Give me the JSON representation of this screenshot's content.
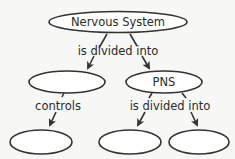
{
  "diagram": {
    "type": "concept-map",
    "nodes": [
      {
        "id": "root",
        "label": "Nervous System"
      },
      {
        "id": "left",
        "label": ""
      },
      {
        "id": "pns",
        "label": "PNS"
      },
      {
        "id": "left-child",
        "label": ""
      },
      {
        "id": "pns-child-1",
        "label": ""
      },
      {
        "id": "pns-child-2",
        "label": ""
      }
    ],
    "links": [
      {
        "from": "root",
        "to": "left",
        "label": "is divided into"
      },
      {
        "from": "root",
        "to": "pns",
        "label": "is divided into"
      },
      {
        "from": "left",
        "to": "left-child",
        "label": "controls"
      },
      {
        "from": "pns",
        "to": "pns-child-1",
        "label": "is divided into"
      },
      {
        "from": "pns",
        "to": "pns-child-2",
        "label": "is divided into"
      }
    ],
    "link_labels": {
      "root_split": "is divided into",
      "left_link": "controls",
      "pns_split": "is divided into"
    },
    "colors": {
      "background": "#f7f7f5",
      "stroke": "#333333",
      "text": "#2a2a2a",
      "node_fill": "#ffffff"
    }
  }
}
